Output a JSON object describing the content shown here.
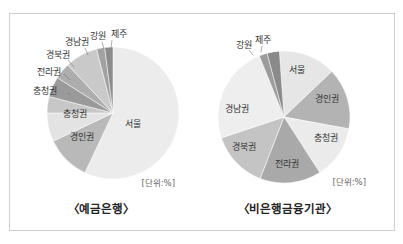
{
  "chart_data": [
    {
      "type": "pie",
      "title": "〈예금은행〉",
      "unit_label": "[단위:%]",
      "categories": [
        "서울",
        "경인권",
        "충청권",
        "충청권",
        "전라권",
        "경북권",
        "경남권",
        "강원",
        "제주"
      ],
      "values": [
        57,
        11,
        7,
        4,
        5,
        4,
        8,
        2,
        2
      ],
      "colors": [
        "#ececec",
        "#b9b9b9",
        "#e3e3e3",
        "#c7c7c7",
        "#9a9a9a",
        "#adadad",
        "#c9c9c9",
        "#a2a2a2",
        "#8c8c8c"
      ],
      "start_angle_deg": 0,
      "direction": "clockwise"
    },
    {
      "type": "pie",
      "title": "〈비은행금융기관〉",
      "unit_label": "[단위:%]",
      "categories": [
        "서울",
        "경인권",
        "충청권",
        "전라권",
        "경북권",
        "경남권",
        "강원",
        "제주"
      ],
      "values": [
        14,
        15,
        13,
        15,
        14,
        24,
        2,
        3
      ],
      "colors": [
        "#e6e6e6",
        "#b3b3b3",
        "#ebebeb",
        "#a9a9a9",
        "#c4c4c4",
        "#eeeeee",
        "#9c9c9c",
        "#8a8a8a"
      ],
      "start_angle_deg": -4,
      "direction": "clockwise"
    }
  ],
  "left": {
    "title": "〈예금은행〉",
    "unit": "[단위:%]",
    "labels": {
      "seoul": "서울",
      "gyeongin": "경인권",
      "chungcheong_inner": "충청권",
      "chungcheong_outer": "충청권",
      "jeolla": "전라권",
      "gyeongbuk": "경북권",
      "gyeongnam": "경남권",
      "gangwon": "강원",
      "jeju": "제주"
    }
  },
  "right": {
    "title": "〈비은행금융기관〉",
    "unit": "[단위:%]",
    "labels": {
      "seoul": "서울",
      "gyeongin": "경인권",
      "chungcheong": "충청권",
      "jeolla": "전라권",
      "gyeongbuk": "경북권",
      "gyeongnam": "경남권",
      "gangwon": "강원",
      "jeju": "제주"
    }
  }
}
